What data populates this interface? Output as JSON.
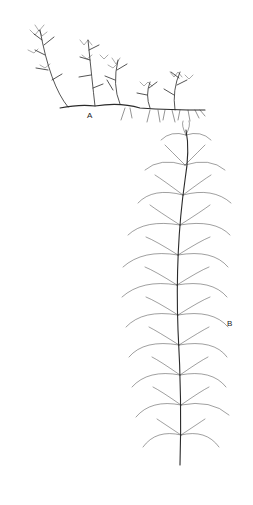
{
  "figure": {
    "labels": {
      "a": "A",
      "b": "B"
    },
    "colors": {
      "ink": "#2a2a2a",
      "background": "#ffffff"
    }
  }
}
